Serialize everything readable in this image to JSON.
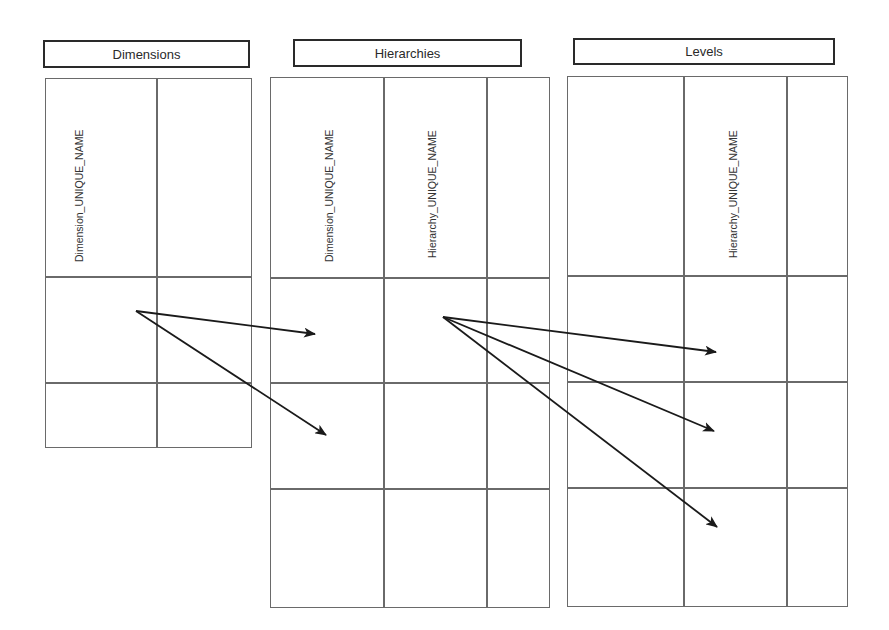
{
  "diagram": {
    "tables": [
      {
        "id": "dimensions",
        "title": "Dimensions",
        "columns": [
          {
            "header": "Dimension_UNIQUE_NAME"
          },
          {
            "header": ""
          }
        ],
        "rows": 2
      },
      {
        "id": "hierarchies",
        "title": "Hierarchies",
        "columns": [
          {
            "header": "Dimension_UNIQUE_NAME"
          },
          {
            "header": "Hierarchy_UNIQUE_NAME"
          },
          {
            "header": ""
          }
        ],
        "rows": 3
      },
      {
        "id": "levels",
        "title": "Levels",
        "columns": [
          {
            "header": ""
          },
          {
            "header": "Hierarchy_UNIQUE_NAME"
          },
          {
            "header": ""
          }
        ],
        "rows": 3
      }
    ],
    "relationships": [
      {
        "from": "Dimensions.Dimension_UNIQUE_NAME row 1",
        "to": "Hierarchies.Dimension_UNIQUE_NAME row 1"
      },
      {
        "from": "Dimensions.Dimension_UNIQUE_NAME row 1",
        "to": "Hierarchies.Dimension_UNIQUE_NAME row 2"
      },
      {
        "from": "Hierarchies.Hierarchy_UNIQUE_NAME row 1",
        "to": "Levels.Hierarchy_UNIQUE_NAME row 1"
      },
      {
        "from": "Hierarchies.Hierarchy_UNIQUE_NAME row 1",
        "to": "Levels.Hierarchy_UNIQUE_NAME row 2"
      },
      {
        "from": "Hierarchies.Hierarchy_UNIQUE_NAME row 1",
        "to": "Levels.Hierarchy_UNIQUE_NAME row 3"
      }
    ],
    "colors": {
      "line": "#6a6a6a",
      "label_border": "#2a2a2a",
      "arrow": "#1a1a1a",
      "background": "#ffffff"
    }
  }
}
